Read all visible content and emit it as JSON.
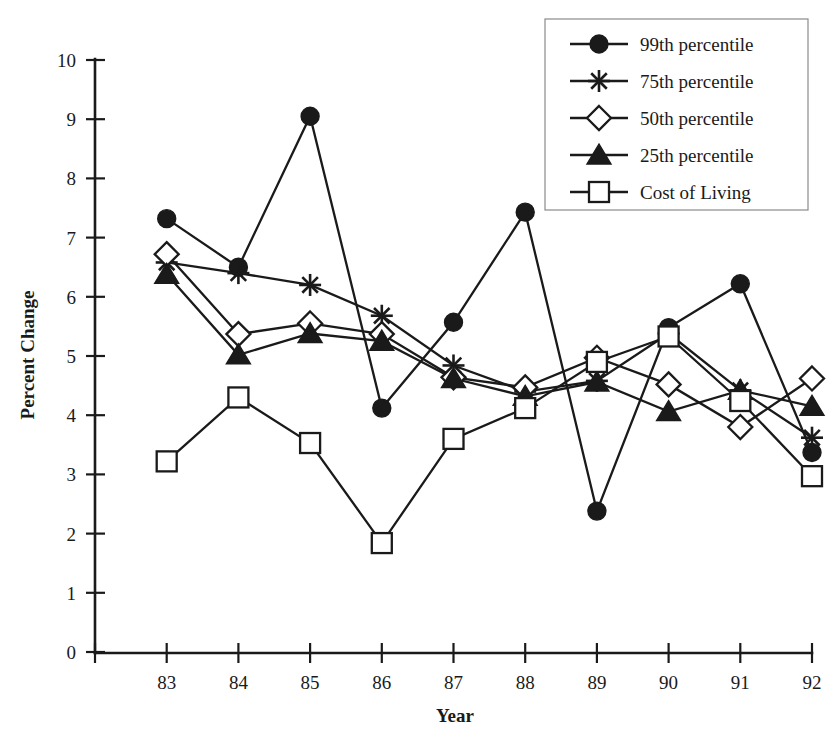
{
  "chart_data": {
    "type": "line",
    "title": "",
    "xlabel": "Year",
    "ylabel": "Percent Change",
    "categories": [
      "83",
      "84",
      "85",
      "86",
      "87",
      "88",
      "89",
      "90",
      "91",
      "92"
    ],
    "xlim": [
      0,
      9
    ],
    "ylim": [
      0,
      10
    ],
    "ytick_labels": [
      "0",
      "1",
      "2",
      "3",
      "4",
      "5",
      "6",
      "7",
      "8",
      "9",
      "10"
    ],
    "ytick_values": [
      0,
      1,
      2,
      3,
      4,
      5,
      6,
      7,
      8,
      9,
      10
    ],
    "grid": false,
    "legend_position": "top-right",
    "series": [
      {
        "name": "99th percentile",
        "marker": "filled-circle",
        "values": [
          7.32,
          6.5,
          9.05,
          4.12,
          5.57,
          7.43,
          2.38,
          6.22,
          3.37,
          3.37
        ]
      },
      {
        "name": "75th percentile",
        "marker": "star",
        "values": [
          6.58,
          6.4,
          6.2,
          5.68,
          4.84,
          4.4,
          4.58,
          5.38,
          4.42,
          3.62
        ]
      },
      {
        "name": "50th percentile",
        "marker": "open-diamond",
        "values": [
          6.72,
          5.37,
          5.55,
          5.37,
          4.64,
          4.47,
          4.97,
          4.52,
          3.8,
          4.62
        ]
      },
      {
        "name": "25th percentile",
        "marker": "filled-triangle",
        "values": [
          6.38,
          5.02,
          5.38,
          5.25,
          4.62,
          4.32,
          4.56,
          4.06,
          4.42,
          4.15
        ]
      },
      {
        "name": "Cost of Living",
        "marker": "open-square",
        "values": [
          3.22,
          4.3,
          3.53,
          1.84,
          3.6,
          4.12,
          4.9,
          5.33,
          4.24,
          2.97
        ]
      }
    ],
    "series_note_99th": "The 99th percentile series has 10 plotted markers; the 1991 value is 6.22 and the 1992 value is 3.37.",
    "values_99th_corrected": [
      7.32,
      6.5,
      9.05,
      4.12,
      5.57,
      7.43,
      2.38,
      5.48,
      6.22,
      3.37
    ],
    "values_75th_corrected": [
      6.58,
      6.4,
      6.2,
      5.68,
      4.84,
      4.4,
      4.58,
      5.38,
      4.42,
      3.62
    ],
    "colors": {
      "ink": "#1a1a1a",
      "background": "#ffffff",
      "legend_border": "#8a8a8a"
    }
  },
  "legend": {
    "entries": [
      {
        "label": "99th percentile",
        "marker": "filled-circle"
      },
      {
        "label": "75th percentile",
        "marker": "star"
      },
      {
        "label": "50th percentile",
        "marker": "open-diamond"
      },
      {
        "label": "25th percentile",
        "marker": "filled-triangle"
      },
      {
        "label": "Cost of Living",
        "marker": "open-square"
      }
    ]
  }
}
